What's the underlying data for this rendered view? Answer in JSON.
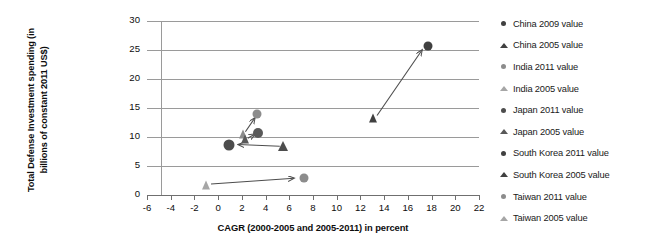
{
  "chart_data": {
    "type": "scatter",
    "title": "",
    "xlabel": "CAGR (2000-2005 and 2005-2011) in percent",
    "ylabel": "Total Defense Investment spending (in billions of constant 2011 US$)",
    "xlim": [
      -6,
      22
    ],
    "ylim": [
      0,
      30
    ],
    "xticks": [
      -6,
      -4,
      -2,
      0,
      2,
      4,
      6,
      8,
      10,
      12,
      14,
      16,
      18,
      20,
      22
    ],
    "yticks": [
      0,
      5,
      10,
      15,
      20,
      25,
      30
    ],
    "xtick_labels": [
      "-6",
      "-4",
      "-2",
      "0",
      "2",
      "4",
      "6",
      "8",
      "10",
      "12",
      "14",
      "16",
      "18",
      "20",
      "22"
    ],
    "ytick_labels": [
      "0",
      "5",
      "10",
      "15",
      "20",
      "25",
      "30"
    ],
    "grid": "horizontal",
    "legend_position": "right",
    "points": [
      {
        "label": "China 2009 value",
        "x": 17.7,
        "y": 25.7,
        "marker": "circle",
        "color": "#404040",
        "size": 9
      },
      {
        "label": "China 2005 value",
        "x": 13.1,
        "y": 13.3,
        "marker": "triangle",
        "color": "#404040",
        "size": 9
      },
      {
        "label": "India 2011 value",
        "x": 3.3,
        "y": 13.9,
        "marker": "circle",
        "color": "#8c8c8c",
        "size": 9
      },
      {
        "label": "India 2005 value",
        "x": 2.1,
        "y": 10.6,
        "marker": "triangle",
        "color": "#8c8c8c",
        "size": 9
      },
      {
        "label": "Japan 2011 value",
        "x": 0.9,
        "y": 8.7,
        "marker": "circle",
        "color": "#4d4d4d",
        "size": 11
      },
      {
        "label": "Japan 2005 value",
        "x": 5.5,
        "y": 8.4,
        "marker": "triangle",
        "color": "#4d4d4d",
        "size": 10
      },
      {
        "label": "South Korea 2011 value",
        "x": 3.4,
        "y": 10.7,
        "marker": "circle",
        "color": "#595959",
        "size": 10
      },
      {
        "label": "South Korea 2005 value",
        "x": 2.3,
        "y": 9.6,
        "marker": "triangle",
        "color": "#595959",
        "size": 9
      },
      {
        "label": "Taiwan 2011 value",
        "x": 7.2,
        "y": 2.9,
        "marker": "circle",
        "color": "#8c8c8c",
        "size": 9
      },
      {
        "label": "Taiwan 2005 value",
        "x": -1.0,
        "y": 1.8,
        "marker": "triangle",
        "color": "#a6a6a6",
        "size": 9
      }
    ],
    "arrows": [
      {
        "name": "china-arrow",
        "from": [
          13.4,
          13.7
        ],
        "to": [
          17.2,
          25.0
        ]
      },
      {
        "name": "japan-arrow",
        "from": [
          5.2,
          8.4
        ],
        "to": [
          1.7,
          8.7
        ]
      },
      {
        "name": "india-arrow",
        "from": [
          2.3,
          10.9
        ],
        "to": [
          3.1,
          13.3
        ]
      },
      {
        "name": "south-korea-arrow",
        "from": [
          2.5,
          9.8
        ],
        "to": [
          3.1,
          10.5
        ]
      },
      {
        "name": "taiwan-arrow",
        "from": [
          -0.6,
          1.9
        ],
        "to": [
          6.4,
          2.9
        ]
      }
    ]
  },
  "legend": {
    "items": [
      {
        "label": "China 2009 value",
        "marker": "circle",
        "color": "#404040"
      },
      {
        "label": "China 2005 value",
        "marker": "triangle",
        "color": "#404040"
      },
      {
        "label": "India 2011 value",
        "marker": "circle",
        "color": "#8c8c8c"
      },
      {
        "label": "India 2005 value",
        "marker": "triangle",
        "color": "#a6a6a6"
      },
      {
        "label": "Japan 2011 value",
        "marker": "circle",
        "color": "#4d4d4d"
      },
      {
        "label": "Japan 2005 value",
        "marker": "triangle",
        "color": "#595959"
      },
      {
        "label": "South Korea 2011 value",
        "marker": "circle",
        "color": "#404040"
      },
      {
        "label": "South Korea 2005 value",
        "marker": "triangle",
        "color": "#404040"
      },
      {
        "label": "Taiwan 2011 value",
        "marker": "circle",
        "color": "#8c8c8c"
      },
      {
        "label": "Taiwan 2005 value",
        "marker": "triangle",
        "color": "#a6a6a6"
      }
    ]
  },
  "colors": {
    "grid": "#9a9a9a",
    "axis": "#6f6f6f",
    "text": "#0d0d0d",
    "arrow": "#4d4d4d"
  }
}
